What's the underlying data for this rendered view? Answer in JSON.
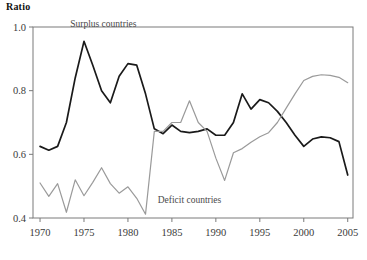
{
  "chart_data": {
    "type": "line",
    "title": "",
    "ylabel": "Ratio",
    "xlabel": "",
    "xlim": [
      1969.2,
      2005.6
    ],
    "ylim": [
      0.4,
      1.0
    ],
    "grid": false,
    "legend_position": "inline-annotations",
    "yticks": [
      "0.4",
      "0.6",
      "0.8",
      "1.0"
    ],
    "ytick_values": [
      0.4,
      0.6,
      0.8,
      1.0
    ],
    "xticks": [
      "1970",
      "1975",
      "1980",
      "1985",
      "1990",
      "1995",
      "2000",
      "2005"
    ],
    "xtick_values": [
      1970,
      1975,
      1980,
      1985,
      1990,
      1995,
      2000,
      2005
    ],
    "x": [
      1970,
      1971,
      1972,
      1973,
      1974,
      1975,
      1976,
      1977,
      1978,
      1979,
      1980,
      1981,
      1982,
      1983,
      1984,
      1985,
      1986,
      1987,
      1988,
      1989,
      1990,
      1991,
      1992,
      1993,
      1994,
      1995,
      1996,
      1997,
      1998,
      1999,
      2000,
      2001,
      2002,
      2003,
      2004,
      2005
    ],
    "series": [
      {
        "name": "Surplus countries",
        "color": "#1a1a1a",
        "label_x": 1977.2,
        "label_y": 1.0,
        "values": [
          0.625,
          0.613,
          0.625,
          0.7,
          0.84,
          0.955,
          0.88,
          0.8,
          0.762,
          0.845,
          0.885,
          0.88,
          0.79,
          0.68,
          0.665,
          0.692,
          0.672,
          0.668,
          0.672,
          0.68,
          0.66,
          0.66,
          0.7,
          0.79,
          0.742,
          0.772,
          0.762,
          0.735,
          0.7,
          0.66,
          0.625,
          0.648,
          0.655,
          0.652,
          0.64,
          0.535
        ]
      },
      {
        "name": "Deficit countries",
        "color": "#9a9a9a",
        "label_x": 1987.0,
        "label_y": 0.448,
        "values": [
          0.51,
          0.468,
          0.508,
          0.418,
          0.52,
          0.47,
          0.512,
          0.558,
          0.508,
          0.478,
          0.498,
          0.462,
          0.412,
          0.672,
          0.672,
          0.7,
          0.7,
          0.768,
          0.7,
          0.672,
          0.588,
          0.518,
          0.605,
          0.618,
          0.638,
          0.655,
          0.668,
          0.7,
          0.745,
          0.79,
          0.832,
          0.845,
          0.85,
          0.848,
          0.842,
          0.825
        ]
      }
    ]
  },
  "annotations": {
    "surplus_label": "Surplus countries",
    "deficit_label": "Deficit countries",
    "axis_title": "Ratio"
  }
}
